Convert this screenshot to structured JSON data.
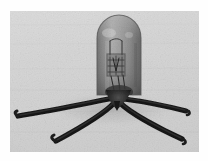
{
  "image": {
    "kind": "photograph",
    "subject": "vacuum tube",
    "alt_text": "Monochrome photograph of an early vacuum tube valve with a rounded glass envelope and four splayed wire leads",
    "medium": "black and white halftone print",
    "orientation": "landscape",
    "width_px": 208,
    "height_px": 161
  },
  "frame": {
    "paper_color": "#fefefe",
    "photo_left": 10,
    "photo_top": 11,
    "photo_width": 189,
    "photo_height": 141,
    "background_color": "#d9d9d9",
    "background_color_light": "#e4e4e4",
    "background_color_dark": "#c9c9c9"
  },
  "subject": {
    "envelope": {
      "name": "glass-envelope",
      "shape": "dome-topped cylinder",
      "center_x": 109,
      "top_y": 5,
      "bottom_y": 84,
      "width": 44,
      "glass_color": "#9a9a9a",
      "glass_highlight": "#c2c2c2",
      "glass_shadow": "#6f6f6f",
      "outline_color": "#5a5a5a"
    },
    "electrodes": {
      "name": "internal-electrode-assembly",
      "description": "grid and plate structure suspended on support wires",
      "color": "#3c3c3c",
      "top_y": 28,
      "bottom_y": 70
    },
    "pinch": {
      "name": "stem-pinch",
      "center_x": 109,
      "center_y": 88,
      "color": "#2a2a2a"
    },
    "leads": [
      {
        "name": "lead-wire-outer-left",
        "start_x": 104,
        "start_y": 88,
        "end_x": 6,
        "end_y": 106,
        "thickness": 5.0,
        "hook": "up",
        "color": "#1e1e1e"
      },
      {
        "name": "lead-wire-inner-left",
        "start_x": 107,
        "start_y": 92,
        "end_x": 43,
        "end_y": 130,
        "thickness": 5.2,
        "hook": "up",
        "color": "#1c1c1c"
      },
      {
        "name": "lead-wire-inner-right",
        "start_x": 112,
        "start_y": 92,
        "end_x": 173,
        "end_y": 128,
        "thickness": 5.2,
        "hook": "down",
        "color": "#1c1c1c"
      },
      {
        "name": "lead-wire-outer-right",
        "start_x": 115,
        "start_y": 88,
        "end_x": 177,
        "end_y": 100,
        "thickness": 5.0,
        "hook": "down",
        "color": "#1e1e1e"
      }
    ],
    "lead_count": 4
  },
  "palette": {
    "darkest": "#161616",
    "dark": "#3a3a3a",
    "mid": "#8c8c8c",
    "light": "#d4d4d4",
    "lightest": "#f2f2f2"
  }
}
